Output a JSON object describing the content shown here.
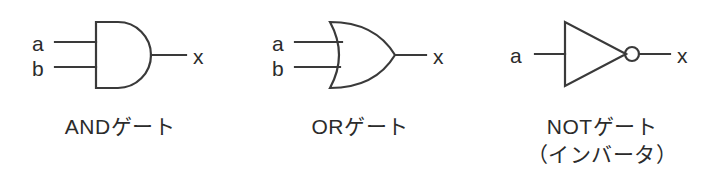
{
  "figure": {
    "background_color": "#ffffff",
    "stroke_color": "#3a3a3a",
    "text_color": "#2b2b2b"
  },
  "gates": [
    {
      "id": "and",
      "symbol_name": "and-gate-symbol",
      "inputs": [
        {
          "label": "a"
        },
        {
          "label": "b"
        }
      ],
      "output": {
        "label": "x"
      },
      "caption_lines": [
        "ANDゲート"
      ]
    },
    {
      "id": "or",
      "symbol_name": "or-gate-symbol",
      "inputs": [
        {
          "label": "a"
        },
        {
          "label": "b"
        }
      ],
      "output": {
        "label": "x"
      },
      "caption_lines": [
        "ORゲート"
      ]
    },
    {
      "id": "not",
      "symbol_name": "not-gate-symbol",
      "inputs": [
        {
          "label": "a"
        }
      ],
      "output": {
        "label": "x"
      },
      "caption_lines": [
        "NOTゲート",
        "（インバータ）"
      ]
    }
  ]
}
